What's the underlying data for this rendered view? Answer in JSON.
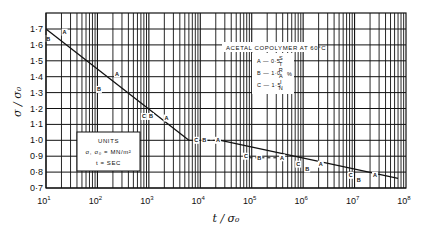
{
  "chart_data": {
    "type": "line",
    "title": "",
    "xlabel": "t / σ₀",
    "ylabel": "σ / σ₀",
    "xscale": "log",
    "xlim": [
      10,
      100000000
    ],
    "ylim": [
      0.7,
      1.75
    ],
    "grid": true,
    "x_ticks": [
      {
        "value": 10,
        "base": "10",
        "exp": "1"
      },
      {
        "value": 100,
        "base": "10",
        "exp": "2"
      },
      {
        "value": 1000,
        "base": "10",
        "exp": "3"
      },
      {
        "value": 10000,
        "base": "10",
        "exp": "4"
      },
      {
        "value": 100000,
        "base": "10",
        "exp": "5"
      },
      {
        "value": 1000000,
        "base": "10",
        "exp": "6"
      },
      {
        "value": 10000000,
        "base": "10",
        "exp": "7"
      },
      {
        "value": 100000000,
        "base": "10",
        "exp": "8"
      }
    ],
    "y_ticks": [
      {
        "value": 1.7,
        "label": "1·7"
      },
      {
        "value": 1.6,
        "label": "1·6"
      },
      {
        "value": 1.5,
        "label": "1·5"
      },
      {
        "value": 1.4,
        "label": "1·4"
      },
      {
        "value": 1.3,
        "label": "1·3"
      },
      {
        "value": 1.2,
        "label": "1·2"
      },
      {
        "value": 1.1,
        "label": "1·1"
      },
      {
        "value": 1.0,
        "label": "1·0"
      },
      {
        "value": 0.9,
        "label": "0·9"
      },
      {
        "value": 0.8,
        "label": "0·8"
      },
      {
        "value": 0.7,
        "label": "0·7"
      }
    ],
    "fit_lines": [
      {
        "name": "short-time line",
        "style": "solid",
        "points": [
          [
            10,
            1.7
          ],
          [
            6000,
            1.0
          ]
        ]
      },
      {
        "name": "long-time line",
        "style": "solid",
        "points": [
          [
            25000,
            1.0
          ],
          [
            70000000,
            0.76
          ]
        ]
      }
    ],
    "shift_segments": [
      {
        "style": "dashed",
        "points": [
          [
            6000,
            1.0
          ],
          [
            25000,
            1.0
          ]
        ]
      },
      {
        "style": "dashed",
        "points": [
          [
            90000,
            0.89
          ],
          [
            420000,
            0.89
          ]
        ]
      }
    ],
    "series": [
      {
        "name": "A",
        "points": [
          [
            23,
            1.68
          ],
          [
            240,
            1.42
          ],
          [
            2200,
            1.14
          ],
          [
            22000,
            1.0
          ],
          [
            390000,
            0.89
          ],
          [
            2200000,
            0.85
          ],
          [
            25000000,
            0.78
          ]
        ]
      },
      {
        "name": "B",
        "points": [
          [
            11,
            1.64
          ],
          [
            107,
            1.32
          ],
          [
            1100,
            1.15
          ],
          [
            12000,
            1.0
          ],
          [
            140000,
            0.89
          ],
          [
            1200000,
            0.82
          ],
          [
            12000000,
            0.75
          ]
        ]
      },
      {
        "name": "C",
        "points": [
          [
            800,
            1.15
          ],
          [
            8300,
            1.0
          ],
          [
            77000,
            0.9
          ],
          [
            800000,
            0.85
          ],
          [
            8400000,
            0.78
          ]
        ]
      }
    ],
    "legend": {
      "placement": "top-right",
      "title": "ACETAL COPOLYMER AT 60°C",
      "entries": [
        {
          "key": "A",
          "text": "A — 0·5"
        },
        {
          "key": "B",
          "text": "B — 1·0"
        },
        {
          "key": "C",
          "text": "C — 1·5"
        }
      ],
      "vertical_label": [
        "S",
        "T",
        "R",
        "A",
        "I",
        "N"
      ],
      "unit": "%"
    },
    "annotations": [
      {
        "placement": "lower-left",
        "lines": [
          "UNITS",
          "σ, σ₀ = MN/m²",
          "t = SEC"
        ]
      }
    ]
  }
}
